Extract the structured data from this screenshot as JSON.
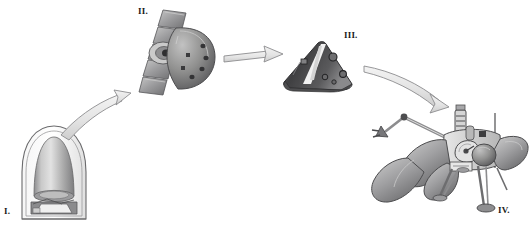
{
  "figure": {
    "title": "",
    "background_color": "#ffffff",
    "width": 529,
    "height": 229,
    "palette": {
      "outline": "#58585a",
      "arrow_fill": "#e9e9e9",
      "arrow_stroke": "#8c8c8e",
      "metal_light": "#d8d8d8",
      "metal_mid": "#a8a8a8",
      "metal_dark": "#6e6e70",
      "shell_dark": "#4a4a4c",
      "highlight_white": "#f4f4f4",
      "label_color": "#1a1a1a"
    }
  },
  "stages": [
    {
      "id": "stage-1",
      "label": "I.",
      "name": "launch-fairing-with-stowed-payload",
      "description": "Rounded aeroshell fairing enclosing a stowed conical payload above a base support structure"
    },
    {
      "id": "stage-2",
      "label": "II.",
      "name": "cruise-stage-with-solar-panels-and-aeroshell",
      "description": "Cruise configuration: segmented solar panel wings on the left joined to a domed heat shield with circular thruster ports"
    },
    {
      "id": "stage-3",
      "label": "III.",
      "name": "entry-aeroshell-cone",
      "description": "Dark conical entry capsule with a pale vertical stripe and circular hatch details"
    },
    {
      "id": "stage-4",
      "label": "IV.",
      "name": "deployed-surface-lander",
      "description": "Fully deployed lander: petal solar panels, dish antenna, spherical tank, instrument mast, robotic boom arm and tripod landing legs with footpads"
    }
  ],
  "arrows": [
    {
      "id": "arrow-1-2",
      "name": "arrow-stage-1-to-2",
      "from": "I.",
      "to": "II.",
      "shape": "curved-up-right"
    },
    {
      "id": "arrow-2-3",
      "name": "arrow-stage-2-to-3",
      "from": "II.",
      "to": "III.",
      "shape": "straight-right"
    },
    {
      "id": "arrow-3-4",
      "name": "arrow-stage-3-to-4",
      "from": "III.",
      "to": "IV.",
      "shape": "curved-down-right"
    }
  ]
}
